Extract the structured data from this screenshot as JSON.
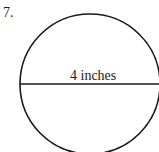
{
  "problem": {
    "number": "7.",
    "figure": {
      "shape": "circle",
      "segment": "diameter",
      "label": "4 inches",
      "stroke_color": "#1a1a1a"
    }
  }
}
